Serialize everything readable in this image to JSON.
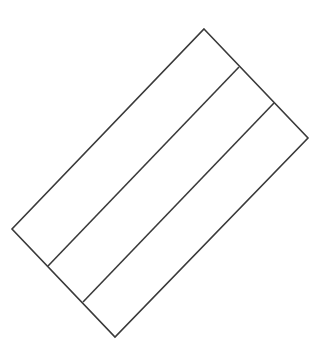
{
  "diagram": {
    "stroke_color": "#3a3a3a",
    "stroke_width": 1.6,
    "background": "#ffffff",
    "outline": {
      "points": "204,29 308,138 115,337 12,229"
    },
    "dividers": [
      {
        "x1": 239,
        "y1": 67,
        "x2": 48,
        "y2": 266
      },
      {
        "x1": 274,
        "y1": 103,
        "x2": 83,
        "y2": 302
      }
    ]
  }
}
